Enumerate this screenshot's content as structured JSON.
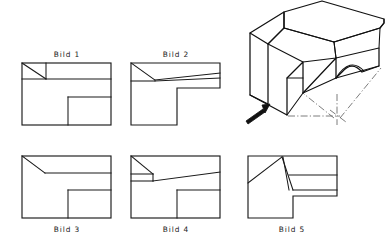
{
  "sheet": {
    "title": "Technical orthographic projection exercise sheet",
    "background_color": "#ffffff",
    "line_color": "#1a1a1a",
    "width": 389,
    "height": 242
  },
  "isometric_view": {
    "name": "isometric-pictorial-view",
    "description": "3D pictorial of an open chair-like block with notch and curved cut-out",
    "view_arrow_label": "",
    "arrow_direction": "up-right",
    "construction_line_style": "dash-dot"
  },
  "figures": [
    {
      "id": "bild-1",
      "label": "Bild 1",
      "label_position": "top",
      "row": 1,
      "column": 1,
      "description": "Rectangle with small triangular chamfer at upper-left and rectangular notch at lower-right"
    },
    {
      "id": "bild-2",
      "label": "Bild 2",
      "label_position": "top",
      "row": 1,
      "column": 2,
      "description": "L-shaped outline with notch cut from lower-left and two converging slanted lines at top"
    },
    {
      "id": "bild-3",
      "label": "Bild 3",
      "label_position": "bottom",
      "row": 2,
      "column": 1,
      "description": "Rectangle with long diagonal chamfer from upper-left and rectangular notch at lower-right"
    },
    {
      "id": "bild-4",
      "label": "Bild 4",
      "label_position": "bottom",
      "row": 2,
      "column": 2,
      "description": "Rectangle with V-notch at upper-left, slanted line and rectangular notch at lower-right"
    },
    {
      "id": "bild-5",
      "label": "Bild 5",
      "label_position": "bottom",
      "row": 2,
      "column": 3,
      "description": "L-shaped outline with peaked diagonal lines forming a gable at the top-centre"
    }
  ],
  "captions": {
    "bild1": "Bild  1",
    "bild2": "Bild  2",
    "bild3": "Bild  3",
    "bild4": "Bild  4",
    "bild5": "Bild  5"
  }
}
